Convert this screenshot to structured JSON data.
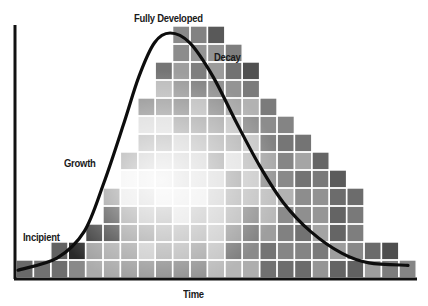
{
  "diagram": {
    "title": "",
    "stage_labels": {
      "incipient": "Incipient",
      "growth": "Growth",
      "fully_developed": "Fully Developed",
      "decay": "Decay"
    },
    "x_axis_label": "Time",
    "colors": {
      "axis": "#111111",
      "curve": "#0d0d0d",
      "grid_lines": "#ffffff",
      "tile_dark": "#2e2e2e",
      "tile_mid": "#8a8a8a",
      "tile_light": "#e8e8e8"
    }
  },
  "chart_data": {
    "type": "area",
    "title": "",
    "xlabel": "Time",
    "ylabel": "",
    "stages": [
      "Incipient",
      "Growth",
      "Fully Developed",
      "Decay"
    ],
    "grid": {
      "columns": 23,
      "cell_width_px": 17.4,
      "cell_height_px": 18
    },
    "column_heights_rows": [
      1,
      1,
      2,
      2,
      3,
      5,
      7,
      10,
      12,
      14,
      14,
      14,
      13,
      12,
      10,
      9,
      8,
      7,
      6,
      5,
      2,
      2,
      1
    ],
    "curve_points_norm": [
      [
        0.0,
        0.02
      ],
      [
        0.1,
        0.07
      ],
      [
        0.17,
        0.18
      ],
      [
        0.22,
        0.38
      ],
      [
        0.27,
        0.62
      ],
      [
        0.31,
        0.82
      ],
      [
        0.35,
        0.96
      ],
      [
        0.39,
        1.0
      ],
      [
        0.44,
        0.96
      ],
      [
        0.5,
        0.82
      ],
      [
        0.56,
        0.63
      ],
      [
        0.62,
        0.45
      ],
      [
        0.68,
        0.3
      ],
      [
        0.75,
        0.18
      ],
      [
        0.83,
        0.09
      ],
      [
        0.9,
        0.05
      ],
      [
        1.0,
        0.04
      ]
    ],
    "annotations": [
      {
        "text": "Incipient",
        "x_norm": 0.02,
        "y_norm": 0.16
      },
      {
        "text": "Growth",
        "x_norm": 0.12,
        "y_norm": 0.47
      },
      {
        "text": "Fully Developed",
        "x_norm": 0.3,
        "y_norm": 1.06
      },
      {
        "text": "Decay",
        "x_norm": 0.49,
        "y_norm": 0.88
      }
    ],
    "grid_lines": false,
    "legend": null
  }
}
